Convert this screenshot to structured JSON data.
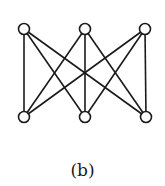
{
  "figure": {
    "caption": "(b)",
    "graph_type": "complete bipartite graph K3,3",
    "colors": {
      "stroke": "#1a1a1a",
      "node_fill": "#ffffff",
      "background": "#ffffff"
    },
    "node_radius": 5.5,
    "nodes": [
      {
        "id": "t1",
        "x": 24,
        "y": 29
      },
      {
        "id": "t2",
        "x": 85,
        "y": 29
      },
      {
        "id": "t3",
        "x": 145,
        "y": 29
      },
      {
        "id": "b1",
        "x": 24,
        "y": 117
      },
      {
        "id": "b2",
        "x": 85,
        "y": 117
      },
      {
        "id": "b3",
        "x": 146,
        "y": 117
      }
    ],
    "edges": [
      [
        "t1",
        "b1"
      ],
      [
        "t1",
        "b2"
      ],
      [
        "t1",
        "b3"
      ],
      [
        "t2",
        "b1"
      ],
      [
        "t2",
        "b2"
      ],
      [
        "t2",
        "b3"
      ],
      [
        "t3",
        "b1"
      ],
      [
        "t3",
        "b2"
      ],
      [
        "t3",
        "b3"
      ]
    ]
  }
}
